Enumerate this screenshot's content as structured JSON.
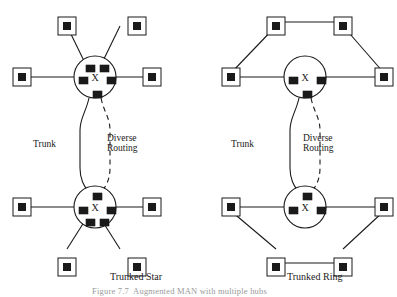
{
  "figure": {
    "caption": "Figure 7.7  Augmented MAN with multiple hubs",
    "background": "#ffffff",
    "ink_color": "#1a1a1a"
  },
  "diagrams": [
    {
      "id": "trunked-star",
      "caption": "Trunked Star",
      "caption_x": 110,
      "caption_y": 272,
      "trunk_label": "Trunk",
      "trunk_label_x": 33,
      "trunk_label_y": 139,
      "diverse_label_line1": "Diverse",
      "diverse_label_line2": "Routing",
      "diverse_label_x": 107,
      "diverse_label_y": 133,
      "hubs": [
        {
          "id": "star-hub-top",
          "cx": 95,
          "cy": 77,
          "r": 21,
          "label": "X",
          "ports": [
            {
              "name": "port-up-left",
              "x": 86,
              "y": 65
            },
            {
              "name": "port-up-right",
              "x": 100,
              "y": 65
            },
            {
              "name": "port-left",
              "x": 79,
              "y": 77
            },
            {
              "name": "port-right",
              "x": 107,
              "y": 77
            },
            {
              "name": "port-bottom",
              "x": 93,
              "y": 91
            }
          ]
        },
        {
          "id": "star-hub-bottom",
          "cx": 95,
          "cy": 207,
          "r": 21,
          "label": "X",
          "ports": [
            {
              "name": "port-top",
              "x": 93,
              "y": 193
            },
            {
              "name": "port-left",
              "x": 79,
              "y": 207
            },
            {
              "name": "port-right",
              "x": 107,
              "y": 207
            },
            {
              "name": "port-down-left",
              "x": 86,
              "y": 219
            },
            {
              "name": "port-down-right",
              "x": 100,
              "y": 219
            }
          ]
        }
      ],
      "nodes": [
        {
          "name": "node-star-top-upleft",
          "x": 58,
          "y": 17
        },
        {
          "name": "node-star-top-upright",
          "x": 128,
          "y": 17
        },
        {
          "name": "node-star-top-left",
          "x": 13,
          "y": 68
        },
        {
          "name": "node-star-top-right",
          "x": 143,
          "y": 68
        },
        {
          "name": "node-star-bottom-left",
          "x": 13,
          "y": 198
        },
        {
          "name": "node-star-bottom-right",
          "x": 143,
          "y": 198
        },
        {
          "name": "node-star-bottom-dnleft",
          "x": 58,
          "y": 258
        },
        {
          "name": "node-star-bottom-dnright",
          "x": 128,
          "y": 258
        }
      ],
      "links": [
        {
          "name": "link-star-top-upleft",
          "d": "M 86 65 L 67 26"
        },
        {
          "name": "link-star-top-upright",
          "d": "M 101 65 L 120 26"
        },
        {
          "name": "link-star-top-left",
          "d": "M 79 77 L 22 77"
        },
        {
          "name": "link-star-top-right",
          "d": "M 107 77 L 152 77"
        },
        {
          "name": "link-star-bot-left",
          "d": "M 79 207 L 22 207"
        },
        {
          "name": "link-star-bot-right",
          "d": "M 107 207 L 152 207"
        },
        {
          "name": "link-star-bot-dnleft",
          "d": "M 86 219 L 67 249"
        },
        {
          "name": "link-star-bot-dnright",
          "d": "M 101 219 L 120 249"
        }
      ],
      "trunk_path": "M 89 98 C 86 112 80 118 80 130 L 80 168 C 80 182 86 188 89 193",
      "diverse_path": "M 101 98 C 104 112 110 118 110 130 L 110 168 C 110 182 104 188 101 193"
    },
    {
      "id": "trunked-ring",
      "caption": "Trunked Ring",
      "caption_x": 287,
      "caption_y": 272,
      "trunk_label": "Trunk",
      "trunk_label_x": 231,
      "trunk_label_y": 139,
      "diverse_label_line1": "Diverse",
      "diverse_label_line2": "Routing",
      "diverse_label_x": 303,
      "diverse_label_y": 133,
      "hubs": [
        {
          "id": "ring-hub-top",
          "cx": 305,
          "cy": 77,
          "r": 21,
          "label": "X",
          "ports": [
            {
              "name": "port-left",
              "x": 289,
              "y": 77
            },
            {
              "name": "port-right",
              "x": 317,
              "y": 77
            },
            {
              "name": "port-bottom",
              "x": 303,
              "y": 91
            }
          ]
        },
        {
          "id": "ring-hub-bottom",
          "cx": 305,
          "cy": 207,
          "r": 21,
          "label": "X",
          "ports": [
            {
              "name": "port-top",
              "x": 303,
              "y": 193
            },
            {
              "name": "port-left",
              "x": 289,
              "y": 207
            },
            {
              "name": "port-right",
              "x": 317,
              "y": 207
            }
          ]
        }
      ],
      "nodes": [
        {
          "name": "node-ring-top-upleft",
          "x": 267,
          "y": 17
        },
        {
          "name": "node-ring-top-upright",
          "x": 334,
          "y": 17
        },
        {
          "name": "node-ring-top-left",
          "x": 222,
          "y": 68
        },
        {
          "name": "node-ring-top-right",
          "x": 375,
          "y": 68
        },
        {
          "name": "node-ring-bottom-left",
          "x": 222,
          "y": 198
        },
        {
          "name": "node-ring-bottom-right",
          "x": 375,
          "y": 198
        },
        {
          "name": "node-ring-bottom-dnleft",
          "x": 267,
          "y": 258
        },
        {
          "name": "node-ring-bottom-dnright",
          "x": 334,
          "y": 258
        }
      ],
      "links": [
        {
          "name": "link-ring-top-left-hub",
          "d": "M 289 77 L 231 77"
        },
        {
          "name": "link-ring-top-right-hub",
          "d": "M 317 77 L 384 77"
        },
        {
          "name": "link-ring-top-left-up",
          "d": "M 231 73 L 276 26"
        },
        {
          "name": "link-ring-top-up-up",
          "d": "M 276 22 L 343 22"
        },
        {
          "name": "link-ring-top-up-right",
          "d": "M 343 26 L 384 73"
        },
        {
          "name": "link-ring-bot-left-hub",
          "d": "M 289 207 L 231 207"
        },
        {
          "name": "link-ring-bot-right-hub",
          "d": "M 317 207 L 384 207"
        },
        {
          "name": "link-ring-bot-left-dn",
          "d": "M 231 211 L 276 249"
        },
        {
          "name": "link-ring-bot-dn-dn",
          "d": "M 276 263 L 343 263"
        },
        {
          "name": "link-ring-bot-dn-right",
          "d": "M 343 249 L 384 211"
        }
      ],
      "trunk_path": "M 299 98 C 296 112 290 118 290 130 L 290 168 C 290 182 296 188 299 193",
      "diverse_path": "M 311 98 C 314 112 320 118 320 130 L 320 168 C 320 182 314 188 311 193"
    }
  ],
  "style": {
    "node_box_size": 18,
    "node_inner_size": 8,
    "port_w": 9,
    "port_h": 7,
    "line_width": 1.1,
    "circle_width": 1.1,
    "dash_pattern": "5,4"
  }
}
